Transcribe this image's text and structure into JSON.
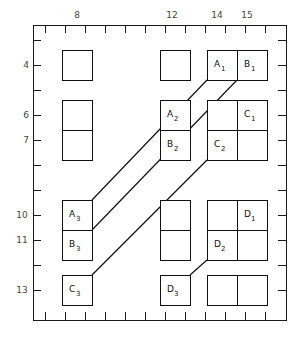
{
  "diagram": {
    "title": "",
    "frame": {
      "x": 33,
      "y": 25,
      "width": 253,
      "height": 295,
      "stroke": "#1a1a1a",
      "stroke_width": 1.4
    },
    "colors": {
      "frame": "#1a1a1a",
      "box": "#111111",
      "connector": "#111111",
      "tick": "#1a1a1a",
      "label": "#3a3a3a",
      "background": "#ffffff"
    },
    "x_axis": {
      "position": "top",
      "tick_count": 12,
      "tick_start": 45,
      "tick_spacing": 20,
      "labels": [
        {
          "text": "8",
          "value": 8,
          "x": 77,
          "y": 18
        },
        {
          "text": "12",
          "value": 12,
          "x": 172,
          "y": 18
        },
        {
          "text": "14",
          "value": 14,
          "x": 217,
          "y": 18
        },
        {
          "text": "15",
          "value": 15,
          "x": 247,
          "y": 18
        }
      ]
    },
    "y_axis": {
      "position": "left",
      "tick_count": 11,
      "tick_start": 40,
      "tick_spacing": 25,
      "labels": [
        {
          "text": "4",
          "value": 4,
          "x": 26,
          "y": 68
        },
        {
          "text": "6",
          "value": 6,
          "x": 26,
          "y": 118
        },
        {
          "text": "7",
          "value": 7,
          "x": 26,
          "y": 143
        },
        {
          "text": "10",
          "value": 10,
          "x": 22,
          "y": 218
        },
        {
          "text": "11",
          "value": 11,
          "x": 22,
          "y": 243
        },
        {
          "text": "13",
          "value": 13,
          "x": 22,
          "y": 293
        }
      ]
    },
    "boxes": [
      {
        "id": "r4c8",
        "x": 62,
        "y": 50,
        "w": 30,
        "h": 30,
        "label": "",
        "sub": ""
      },
      {
        "id": "r4c12",
        "x": 160,
        "y": 50,
        "w": 30,
        "h": 30,
        "label": "",
        "sub": ""
      },
      {
        "id": "r4c14",
        "x": 207,
        "y": 50,
        "w": 30,
        "h": 30,
        "label": "A",
        "sub": "1"
      },
      {
        "id": "r4c15",
        "x": 237,
        "y": 50,
        "w": 30,
        "h": 30,
        "label": "B",
        "sub": "1"
      },
      {
        "id": "r6c8",
        "x": 62,
        "y": 100,
        "w": 30,
        "h": 30,
        "label": "",
        "sub": ""
      },
      {
        "id": "r7c8",
        "x": 62,
        "y": 130,
        "w": 30,
        "h": 30,
        "label": "",
        "sub": ""
      },
      {
        "id": "r6c12",
        "x": 160,
        "y": 100,
        "w": 30,
        "h": 30,
        "label": "A",
        "sub": "2"
      },
      {
        "id": "r7c12",
        "x": 160,
        "y": 130,
        "w": 30,
        "h": 30,
        "label": "B",
        "sub": "2"
      },
      {
        "id": "r6c14",
        "x": 207,
        "y": 100,
        "w": 30,
        "h": 30,
        "label": "",
        "sub": ""
      },
      {
        "id": "r6c15",
        "x": 237,
        "y": 100,
        "w": 30,
        "h": 30,
        "label": "C",
        "sub": "1"
      },
      {
        "id": "r7c14",
        "x": 207,
        "y": 130,
        "w": 30,
        "h": 30,
        "label": "C",
        "sub": "2"
      },
      {
        "id": "r7c15",
        "x": 237,
        "y": 130,
        "w": 30,
        "h": 30,
        "label": "",
        "sub": ""
      },
      {
        "id": "r10c8",
        "x": 62,
        "y": 200,
        "w": 30,
        "h": 30,
        "label": "A",
        "sub": "3"
      },
      {
        "id": "r11c8",
        "x": 62,
        "y": 230,
        "w": 30,
        "h": 30,
        "label": "B",
        "sub": "3"
      },
      {
        "id": "r10c12",
        "x": 160,
        "y": 200,
        "w": 30,
        "h": 30,
        "label": "",
        "sub": ""
      },
      {
        "id": "r11c12",
        "x": 160,
        "y": 230,
        "w": 30,
        "h": 30,
        "label": "",
        "sub": ""
      },
      {
        "id": "r10c14",
        "x": 207,
        "y": 200,
        "w": 30,
        "h": 30,
        "label": "",
        "sub": ""
      },
      {
        "id": "r10c15",
        "x": 237,
        "y": 200,
        "w": 30,
        "h": 30,
        "label": "D",
        "sub": "1"
      },
      {
        "id": "r11c14",
        "x": 207,
        "y": 230,
        "w": 30,
        "h": 30,
        "label": "D",
        "sub": "2"
      },
      {
        "id": "r11c15",
        "x": 237,
        "y": 230,
        "w": 30,
        "h": 30,
        "label": "",
        "sub": ""
      },
      {
        "id": "r13c8",
        "x": 62,
        "y": 275,
        "w": 30,
        "h": 30,
        "label": "C",
        "sub": "3"
      },
      {
        "id": "r13c12",
        "x": 160,
        "y": 275,
        "w": 30,
        "h": 30,
        "label": "D",
        "sub": "3"
      },
      {
        "id": "r13c14",
        "x": 207,
        "y": 275,
        "w": 30,
        "h": 30,
        "label": "",
        "sub": ""
      },
      {
        "id": "r13c15",
        "x": 237,
        "y": 275,
        "w": 30,
        "h": 30,
        "label": "",
        "sub": ""
      }
    ],
    "connectors": [
      {
        "id": "conn-a",
        "from": "A3",
        "to": "A1",
        "x1": 92,
        "y1": 200,
        "x2": 207,
        "y2": 80
      },
      {
        "id": "conn-b",
        "from": "B3",
        "to": "B1",
        "x1": 92,
        "y1": 230,
        "x2": 237,
        "y2": 80
      },
      {
        "id": "conn-c",
        "from": "C3",
        "to": "C2",
        "x1": 92,
        "y1": 275,
        "x2": 207,
        "y2": 160
      },
      {
        "id": "conn-d",
        "from": "D3",
        "to": "D2",
        "x1": 190,
        "y1": 275,
        "x2": 207,
        "y2": 260
      }
    ]
  }
}
